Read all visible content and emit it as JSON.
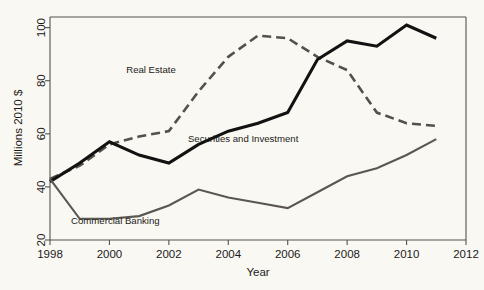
{
  "chart_data": {
    "type": "line",
    "title": "",
    "xlabel": "Year",
    "ylabel": "Millions 2010 $",
    "xlim": [
      1998,
      2012
    ],
    "ylim": [
      20,
      104
    ],
    "grid": false,
    "legend_position": "inline-annotations",
    "background_color": "#faf8f2",
    "xticks": [
      1998,
      2000,
      2002,
      2004,
      2006,
      2008,
      2010,
      2012
    ],
    "yticks": [
      20,
      40,
      60,
      80,
      100
    ],
    "x": [
      1998,
      1999,
      2000,
      2001,
      2002,
      2003,
      2004,
      2005,
      2006,
      2007,
      2008,
      2009,
      2010,
      2011
    ],
    "series": [
      {
        "name": "Real Estate",
        "style": "dashed",
        "color": "#555049",
        "width": 2.6,
        "values": [
          43,
          48,
          56,
          59,
          61,
          76,
          89,
          97,
          96,
          89,
          84,
          68,
          64,
          63
        ],
        "label_x": 2001.4,
        "label_y": 83
      },
      {
        "name": "Securities and Investment",
        "style": "solid",
        "color": "#121212",
        "width": 3.1,
        "values": [
          42,
          49,
          57,
          52,
          49,
          56,
          61,
          64,
          68,
          88,
          95,
          93,
          101,
          96
        ],
        "label_x": 2004.5,
        "label_y": 57
      },
      {
        "name": "Commercial Banking",
        "style": "solid",
        "color": "#5b5650",
        "width": 2.1,
        "values": [
          43,
          28,
          28,
          29,
          33,
          39,
          36,
          34,
          32,
          38,
          44,
          47,
          52,
          58
        ],
        "label_x": 2000.2,
        "label_y": 26
      }
    ]
  },
  "axes": {
    "ylabel": "Millions 2010 $",
    "xlabel": "Year",
    "ytick_labels": [
      "20",
      "40",
      "60",
      "80",
      "100"
    ],
    "xtick_labels": [
      "1998",
      "2000",
      "2002",
      "2004",
      "2006",
      "2008",
      "2010",
      "2012"
    ]
  }
}
